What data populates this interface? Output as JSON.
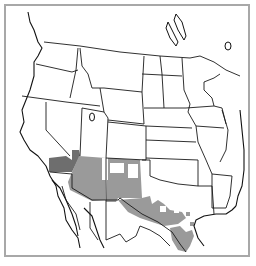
{
  "map": {
    "title": "Range map: southwestern North America",
    "region": "Western and central United States and northern Mexico",
    "frame_color": "#a8a8a8",
    "background_color": "#ffffff",
    "border_color": "#1a1a1a",
    "legend": [],
    "shaded_areas": [
      {
        "name": "southern-california-nevada",
        "shade": "dark",
        "color": "#6e6e6e"
      },
      {
        "name": "arizona",
        "shade": "medium",
        "color": "#9a9a9a"
      },
      {
        "name": "new-mexico",
        "shade": "medium",
        "color": "#9a9a9a"
      },
      {
        "name": "west-and-central-texas",
        "shade": "medium",
        "color": "#9a9a9a"
      },
      {
        "name": "south-texas",
        "shade": "medium",
        "color": "#9a9a9a"
      }
    ]
  }
}
